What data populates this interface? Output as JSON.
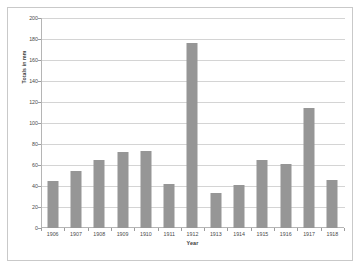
{
  "chart_data": {
    "type": "bar",
    "title": "",
    "xlabel": "Year",
    "ylabel": "Totals in mm",
    "categories": [
      "1906",
      "1907",
      "1908",
      "1909",
      "1910",
      "1911",
      "1912",
      "1913",
      "1914",
      "1915",
      "1916",
      "1917",
      "1918"
    ],
    "values": [
      45,
      54,
      65,
      72,
      73,
      42,
      176,
      33,
      41,
      65,
      61,
      114,
      46
    ],
    "ylim": [
      0,
      200
    ],
    "yticks": [
      0,
      20,
      40,
      60,
      80,
      100,
      120,
      140,
      160,
      180,
      200
    ],
    "ytick_labels": [
      "0",
      "20",
      "40",
      "60",
      "80",
      "100",
      "120",
      "140",
      "160",
      "180",
      "200"
    ],
    "grid": true,
    "legend": false,
    "series_color": "#969696",
    "gridline_color": "#d4d4d4",
    "axis_color": "#b5b5b5",
    "frame_color": "#c9c9c9",
    "text_color": "#4a4a4a"
  }
}
